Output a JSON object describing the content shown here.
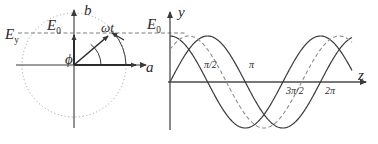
{
  "figure": {
    "stroke_color": "#3a3a3a",
    "dotted_color": "#8a8a8a",
    "dashed_color": "#7a7a7a",
    "background": "#ffffff"
  },
  "left_panel": {
    "name": "phasor-diagram",
    "axes": {
      "horizontal_label": "a",
      "vertical_label": "b"
    },
    "labels": {
      "amplitude_circle": "E",
      "amplitude_circle_sub": "y",
      "amplitude_vertical": "E",
      "amplitude_vertical_sub": "0",
      "angular_position": "ωt",
      "phase_angle": "ϕ"
    },
    "geometry": {
      "origin_x": 74,
      "origin_y": 65,
      "circle_radius": 52,
      "phasor_angle_deg": 52,
      "phasor_length": 52
    }
  },
  "right_panel": {
    "name": "wave-plot",
    "axes": {
      "horizontal_label": "z",
      "vertical_label": "y"
    },
    "labels": {
      "amplitude": "E",
      "amplitude_sub": "0"
    },
    "tick_labels": [
      "π/2",
      "π",
      "3π/2",
      "2π"
    ],
    "tick_positions_rad": [
      1.5708,
      3.1416,
      4.7124,
      6.2832
    ]
  },
  "chart_data": {
    "type": "line",
    "title": "",
    "xlabel": "z",
    "ylabel": "y",
    "xlim": [
      0,
      7.6
    ],
    "ylim": [
      -1.15,
      1.15
    ],
    "grid": false,
    "legend": "none",
    "x_ticks": [
      1.5708,
      3.1416,
      4.7124,
      6.2832
    ],
    "x_tick_labels": [
      "π/2",
      "π",
      "3π/2",
      "2π"
    ],
    "series": [
      {
        "name": "wave-solid-sine",
        "style": "solid",
        "amplitude": 1.0,
        "phase_rad": 0.0,
        "function": "E0*sin(z)"
      },
      {
        "name": "wave-solid-cosine",
        "style": "solid",
        "amplitude": 1.0,
        "phase_rad": 1.5708,
        "function": "E0*cos(z)"
      },
      {
        "name": "wave-dashed",
        "style": "dashed",
        "amplitude": 1.0,
        "phase_rad": 0.7854,
        "function": "E0*cos(z - pi/4)"
      }
    ]
  }
}
